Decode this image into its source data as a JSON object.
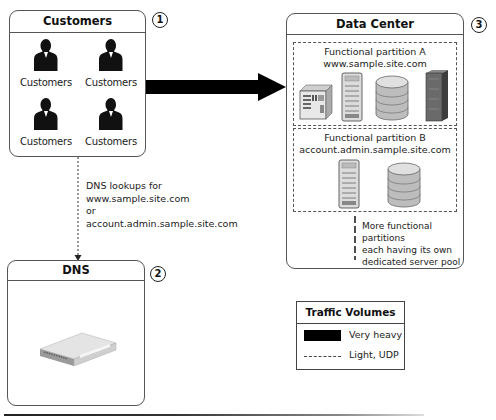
{
  "customers_box": {
    "title": "Customers",
    "number": "1",
    "people": [
      {
        "label": "Customers"
      },
      {
        "label": "Customers"
      },
      {
        "label": "Customers"
      },
      {
        "label": "Customers"
      }
    ]
  },
  "dns_box": {
    "title": "DNS",
    "number": "2",
    "device": "network-appliance"
  },
  "data_center_box": {
    "title": "Data Center",
    "number": "3",
    "partition_a": {
      "line1": "Functional partition A",
      "line2": "www.sample.site.com",
      "servers": [
        "server-unit",
        "tower-server",
        "database",
        "rack-server"
      ]
    },
    "partition_b": {
      "line1": "Functional partition B",
      "line2": "account.admin.sample.site.com",
      "servers": [
        "tower-server",
        "database"
      ]
    },
    "more_note": {
      "line1": "More functional partitions",
      "line2": "each having its own",
      "line3": "dedicated server pool"
    }
  },
  "dns_lookup_note": {
    "line1": "DNS lookups for",
    "line2": "www.sample.site.com",
    "line3": "or",
    "line4": "account.admin.sample.site.com"
  },
  "legend": {
    "title": "Traffic Volumes",
    "items": [
      {
        "style": "solid-thick",
        "label": "Very heavy"
      },
      {
        "style": "dashed-thin",
        "label": "Light, UDP"
      }
    ]
  },
  "colors": {
    "arrow": "#000000",
    "border": "#555555",
    "text": "#1a1a1a"
  }
}
